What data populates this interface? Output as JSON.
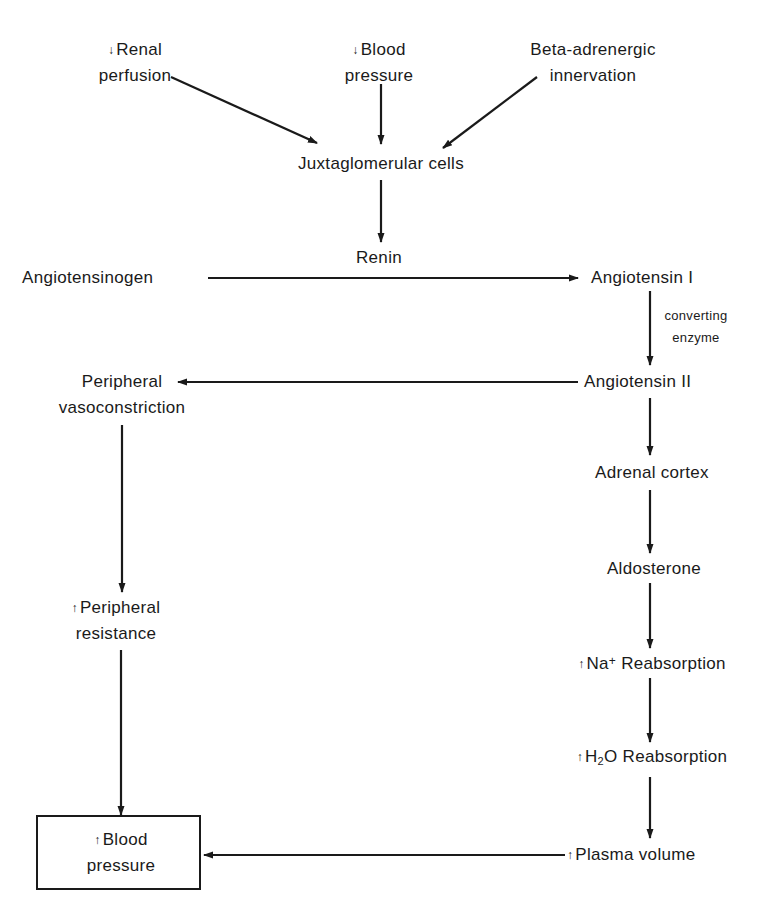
{
  "diagram": {
    "colors": {
      "ink": "#1a1a1a",
      "background": "#ffffff"
    },
    "nodes": {
      "renal_perfusion": {
        "arrow": "↓",
        "line1": "Renal",
        "line2": "perfusion"
      },
      "blood_pressure_low": {
        "arrow": "↓",
        "line1": "Blood",
        "line2": "pressure"
      },
      "beta_adrenergic": {
        "line1": "Beta-adrenergic",
        "line2": "innervation"
      },
      "juxtaglomerular": {
        "label": "Juxtaglomerular cells"
      },
      "renin": {
        "label": "Renin"
      },
      "angiotensinogen": {
        "label": "Angiotensinogen"
      },
      "angiotensin_1": {
        "label": "Angiotensin I"
      },
      "converting_enzyme": {
        "line1": "converting",
        "line2": "enzyme"
      },
      "angiotensin_2": {
        "label": "Angiotensin II"
      },
      "peripheral_vasoconstriction": {
        "line1": "Peripheral",
        "line2": "vasoconstriction"
      },
      "adrenal_cortex": {
        "label": "Adrenal cortex"
      },
      "aldosterone": {
        "label": "Aldosterone"
      },
      "na_reabsorption": {
        "arrow": "↑",
        "prefix": "Na",
        "sup": "+",
        "suffix": " Reabsorption"
      },
      "h2o_reabsorption": {
        "arrow": "↑",
        "prefix": "H",
        "sub": "2",
        "suffix": "O Reabsorption"
      },
      "peripheral_resistance": {
        "arrow": "↑",
        "line1": "Peripheral",
        "line2": "resistance"
      },
      "plasma_volume": {
        "arrow": "↑",
        "label": "Plasma volume"
      },
      "blood_pressure_high": {
        "arrow": "↑",
        "line1": "Blood",
        "line2": "pressure"
      }
    },
    "edges": [
      {
        "from": "Renal perfusion",
        "to": "Juxtaglomerular cells"
      },
      {
        "from": "Blood pressure (decreased)",
        "to": "Juxtaglomerular cells"
      },
      {
        "from": "Beta-adrenergic innervation",
        "to": "Juxtaglomerular cells"
      },
      {
        "from": "Juxtaglomerular cells",
        "to": "Renin"
      },
      {
        "from": "Angiotensinogen",
        "to": "Angiotensin I",
        "label": "Renin"
      },
      {
        "from": "Angiotensin I",
        "to": "Angiotensin II",
        "label": "converting enzyme"
      },
      {
        "from": "Angiotensin II",
        "to": "Peripheral vasoconstriction"
      },
      {
        "from": "Angiotensin II",
        "to": "Adrenal cortex"
      },
      {
        "from": "Adrenal cortex",
        "to": "Aldosterone"
      },
      {
        "from": "Aldosterone",
        "to": "Na+ Reabsorption"
      },
      {
        "from": "Na+ Reabsorption",
        "to": "H2O Reabsorption"
      },
      {
        "from": "H2O Reabsorption",
        "to": "Plasma volume"
      },
      {
        "from": "Peripheral vasoconstriction",
        "to": "Peripheral resistance"
      },
      {
        "from": "Peripheral resistance",
        "to": "Blood pressure (increased)"
      },
      {
        "from": "Plasma volume",
        "to": "Blood pressure (increased)"
      }
    ]
  }
}
